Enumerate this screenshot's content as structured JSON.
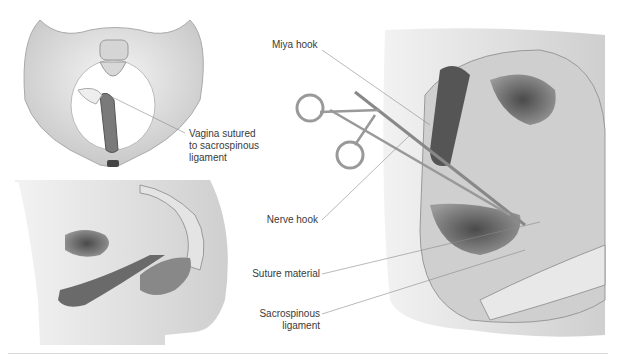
{
  "figure": {
    "panels": [
      {
        "id": "pelvis-front-view",
        "description": "Pelvis anterior view with vagina sutured to sacrospinous ligament"
      },
      {
        "id": "pelvis-sagittal-view",
        "description": "Sagittal section of female pelvis"
      },
      {
        "id": "surgical-view",
        "description": "Sacrospinous fixation with Miya hook and nerve hook"
      }
    ],
    "labels": {
      "vagina_sutured_1": "Vagina sutured",
      "vagina_sutured_2": "to sacrospinous",
      "vagina_sutured_3": "ligament",
      "miya_hook": "Miya hook",
      "nerve_hook": "Nerve hook",
      "suture_material": "Suture material",
      "sacrospinous_1": "Sacrospinous",
      "sacrospinous_2": "ligament"
    },
    "colors": {
      "bone": "#e6e6e6",
      "tissue_dark": "#6e6e6e",
      "tissue_mid": "#9a9a9a",
      "skin": "#d9d9d9",
      "leader_line": "#8a8a8a",
      "text": "#3a3a3a"
    }
  }
}
